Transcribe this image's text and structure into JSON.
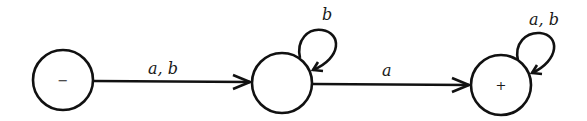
{
  "diagram": {
    "type": "finite-automaton",
    "states": [
      {
        "id": "s1",
        "marker": "−",
        "role": "start",
        "cx": 63,
        "cy": 80
      },
      {
        "id": "s2",
        "marker": "",
        "role": "intermediate",
        "cx": 282,
        "cy": 83
      },
      {
        "id": "s3",
        "marker": "+",
        "role": "final",
        "cx": 501,
        "cy": 85
      }
    ],
    "transitions": [
      {
        "from": "s1",
        "to": "s2",
        "label": "a, b"
      },
      {
        "from": "s2",
        "to": "s2",
        "label": "b"
      },
      {
        "from": "s2",
        "to": "s3",
        "label": "a"
      },
      {
        "from": "s3",
        "to": "s3",
        "label": "a, b"
      }
    ],
    "colors": {
      "stroke": "#111111",
      "background": "#ffffff"
    }
  }
}
